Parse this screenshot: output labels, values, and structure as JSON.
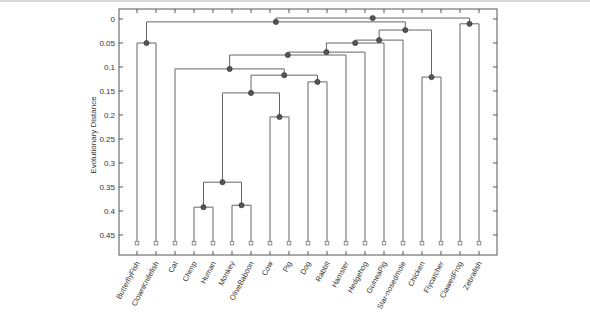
{
  "chart_data": {
    "type": "dendrogram",
    "title": "",
    "xlabel": "",
    "ylabel": "Evolutionary Distance",
    "ylim": [
      -0.02,
      0.48
    ],
    "y_inverted": true,
    "yticks": [
      0,
      0.05,
      0.1,
      0.15,
      0.2,
      0.25,
      0.3,
      0.35,
      0.4,
      0.45
    ],
    "ytick_labels": [
      "0",
      "0.05",
      "0.1",
      "0.15",
      "0.2",
      "0.25",
      "0.3",
      "0.35",
      "0.4",
      "0.45"
    ],
    "leaf_height": 0.467,
    "leaves": [
      "ButterflyFish",
      "ClownKnifefish",
      "Cat",
      "Chimp",
      "Human",
      "Monkey",
      "OliveBaboon",
      "Cow",
      "Pig",
      "Dog",
      "Rabbit",
      "Hamster",
      "Hedgehog",
      "GuineaPig",
      "Star-nosedmole",
      "Chicken",
      "Flycatcher",
      "ClawedFrog",
      "Zebrafish"
    ],
    "nodes": [
      {
        "id": "A",
        "children": [
          "ButterflyFish",
          "ClownKnifefish"
        ],
        "height": 0.05
      },
      {
        "id": "B",
        "children": [
          "Chimp",
          "Human"
        ],
        "height": 0.392
      },
      {
        "id": "C",
        "children": [
          "Monkey",
          "OliveBaboon"
        ],
        "height": 0.388
      },
      {
        "id": "D",
        "children": [
          "B",
          "C"
        ],
        "height": 0.34
      },
      {
        "id": "E",
        "children": [
          "Cow",
          "Pig"
        ],
        "height": 0.204
      },
      {
        "id": "F",
        "children": [
          "D",
          "E"
        ],
        "height": 0.154
      },
      {
        "id": "G",
        "children": [
          "Dog",
          "Rabbit"
        ],
        "height": 0.131
      },
      {
        "id": "H",
        "children": [
          "F",
          "G"
        ],
        "height": 0.117
      },
      {
        "id": "I",
        "children": [
          "Cat",
          "H"
        ],
        "height": 0.104
      },
      {
        "id": "J",
        "children": [
          "I",
          "Hamster"
        ],
        "height": 0.075
      },
      {
        "id": "K",
        "children": [
          "J",
          "Hedgehog"
        ],
        "height": 0.069
      },
      {
        "id": "L",
        "children": [
          "K",
          "GuineaPig"
        ],
        "height": 0.05
      },
      {
        "id": "M",
        "children": [
          "L",
          "Star-nosedmole"
        ],
        "height": 0.044
      },
      {
        "id": "N",
        "children": [
          "Chicken",
          "Flycatcher"
        ],
        "height": 0.121
      },
      {
        "id": "O",
        "children": [
          "M",
          "N"
        ],
        "height": 0.023
      },
      {
        "id": "P",
        "children": [
          "A",
          "O"
        ],
        "height": 0.006
      },
      {
        "id": "Q",
        "children": [
          "ClawedFrog",
          "Zebrafish"
        ],
        "height": 0.01
      },
      {
        "id": "Root",
        "children": [
          "P",
          "Q"
        ],
        "height": -0.002
      }
    ],
    "grid": false,
    "legend": null
  }
}
